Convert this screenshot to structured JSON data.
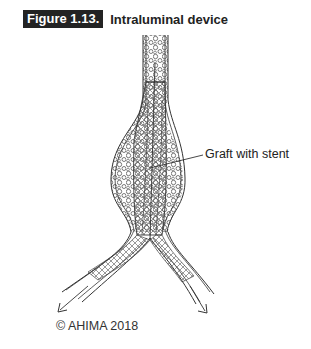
{
  "figure": {
    "number": "Figure 1.13.",
    "title": "Intraluminal device"
  },
  "diagram": {
    "labels": [
      {
        "text": "Graft with stent"
      }
    ],
    "line_color": "#333333",
    "fill_color": "#ffffff"
  },
  "copyright": "© AHIMA 2018"
}
